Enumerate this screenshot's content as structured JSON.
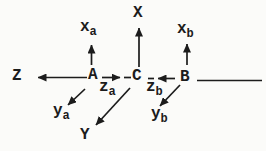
{
  "colors": {
    "ink": "#1c1c1c",
    "paper": "#fbfbf9"
  },
  "labels": {
    "axis_X": "X",
    "axis_Y": "Y",
    "axis_Z": "Z",
    "point_A": "A",
    "point_B": "B",
    "point_C": "C",
    "x_a": {
      "main": "x",
      "sub": "a"
    },
    "y_a": {
      "main": "y",
      "sub": "a"
    },
    "z_a": {
      "main": "z",
      "sub": "a"
    },
    "x_b": {
      "main": "x",
      "sub": "b"
    },
    "y_b": {
      "main": "y",
      "sub": "b"
    },
    "z_b": {
      "main": "z",
      "sub": "b"
    }
  }
}
